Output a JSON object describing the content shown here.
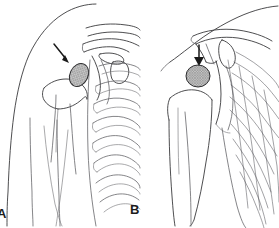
{
  "figure": {
    "kind": "medical-line-illustration",
    "background_color": "#ffffff",
    "ink_color": "#3a3a3c",
    "width": 279,
    "height": 228,
    "panels": [
      {
        "id": "A",
        "label": "A",
        "view": "oblique-shoulder-view",
        "label_position": {
          "x": -3,
          "y": 207
        },
        "region": {
          "x": 0,
          "y": 0,
          "width": 140,
          "height": 228
        },
        "annotation": {
          "marker": "arrow",
          "marker_name": "pointer-arrow",
          "direction": "down-right",
          "tip": {
            "x": 68,
            "y": 62
          },
          "tail": {
            "x": 55,
            "y": 45
          }
        },
        "lesion": {
          "name": "mass-lesion",
          "shape": "oval",
          "texture": "stipple-crosshatch",
          "fill_color": "#b7b7b7",
          "outline_color": "#2e2e30",
          "center": {
            "x": 79,
            "y": 75
          },
          "radius_x": 9,
          "radius_y": 12,
          "rotation_deg": 25
        },
        "structures": [
          "deltoid-soft-tissue-outline",
          "humeral-head",
          "humeral-shaft",
          "glenoid",
          "clavicle",
          "acromion",
          "coracoid-process",
          "scapular-spine",
          "rib-cage"
        ]
      },
      {
        "id": "B",
        "label": "B",
        "view": "frontal-shoulder-view",
        "label_position": {
          "x": 130,
          "y": 203
        },
        "region": {
          "x": 140,
          "y": 0,
          "width": 139,
          "height": 228
        },
        "annotation": {
          "marker": "arrow",
          "marker_name": "pointer-arrow",
          "direction": "down",
          "tip": {
            "x": 199,
            "y": 64
          },
          "tail": {
            "x": 199,
            "y": 46
          }
        },
        "lesion": {
          "name": "mass-lesion",
          "shape": "round",
          "texture": "stipple-crosshatch",
          "fill_color": "#b7b7b7",
          "outline_color": "#2e2e30",
          "center": {
            "x": 198,
            "y": 76
          },
          "radius_x": 12,
          "radius_y": 11,
          "rotation_deg": 0
        },
        "structures": [
          "neck-soft-tissue-outline",
          "clavicle",
          "acromion",
          "coracoid-process",
          "humeral-head",
          "humeral-shaft",
          "glenoid",
          "rib-cage",
          "lateral-chest-wall"
        ]
      }
    ]
  }
}
